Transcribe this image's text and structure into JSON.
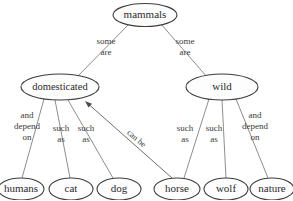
{
  "diagram": {
    "background_color": "#ffffff",
    "node_fill": "#fdfdfd",
    "node_stroke": "#3d3d3d",
    "connector_color": "#808080",
    "arrow_color": "#6e6e6e",
    "text_color": "#2b2b2b",
    "nodes": [
      {
        "id": "mammals",
        "label": "mammals",
        "cx": 145,
        "cy": 15,
        "rx": 32,
        "ry": 11.5
      },
      {
        "id": "domesticated",
        "label": "domesticated",
        "cx": 60,
        "cy": 87,
        "rx": 39,
        "ry": 13
      },
      {
        "id": "wild",
        "label": "wild",
        "cx": 222,
        "cy": 87,
        "rx": 36,
        "ry": 13
      },
      {
        "id": "humans",
        "label": "humans",
        "cx": 21,
        "cy": 189,
        "rx": 23,
        "ry": 11
      },
      {
        "id": "cat",
        "label": "cat",
        "cx": 71,
        "cy": 189,
        "rx": 22,
        "ry": 11
      },
      {
        "id": "dog",
        "label": "dog",
        "cx": 119,
        "cy": 189,
        "rx": 22,
        "ry": 11
      },
      {
        "id": "horse",
        "label": "horse",
        "cx": 177,
        "cy": 189,
        "rx": 23,
        "ry": 11
      },
      {
        "id": "wolf",
        "label": "wolf",
        "cx": 226,
        "cy": 189,
        "rx": 22,
        "ry": 11
      },
      {
        "id": "nature",
        "label": "nature",
        "cx": 272,
        "cy": 189,
        "rx": 22,
        "ry": 11
      }
    ],
    "edges": [
      {
        "id": "mammals-domesticated",
        "from": "mammals",
        "to": "domesticated",
        "label": "some are",
        "x1": 129,
        "y1": 24,
        "x2": 77,
        "y2": 77
      },
      {
        "id": "mammals-wild",
        "from": "mammals",
        "to": "wild",
        "label": "some are",
        "x1": 161,
        "y1": 24,
        "x2": 207,
        "y2": 77
      },
      {
        "id": "domesticated-humans",
        "from": "domesticated",
        "to": "humans",
        "label": "and depend on",
        "x1": 44,
        "y1": 99,
        "x2": 22,
        "y2": 178
      },
      {
        "id": "domesticated-cat",
        "from": "domesticated",
        "to": "cat",
        "label": "such as",
        "x1": 55,
        "y1": 100,
        "x2": 70,
        "y2": 178
      },
      {
        "id": "domesticated-dog",
        "from": "domesticated",
        "to": "dog",
        "label": "such as",
        "x1": 68,
        "y1": 100,
        "x2": 113,
        "y2": 178
      },
      {
        "id": "wild-wolf2",
        "from": "wild",
        "to": "horse",
        "label": "such as",
        "x1": 209,
        "y1": 99,
        "x2": 184,
        "y2": 178
      },
      {
        "id": "wild-wolf",
        "from": "wild",
        "to": "wolf",
        "label": "such as",
        "x1": 222,
        "y1": 100,
        "x2": 226,
        "y2": 178
      },
      {
        "id": "wild-nature",
        "from": "wild",
        "to": "nature",
        "label": "and depend on",
        "x1": 236,
        "y1": 99,
        "x2": 268,
        "y2": 178
      }
    ],
    "arrow": {
      "id": "horse-can-be-domesticated",
      "from": "horse",
      "to": "domesticated",
      "label": "can be",
      "x1": 172,
      "y1": 178,
      "x2": 85,
      "y2": 101
    },
    "edge_labels": [
      {
        "id": "label-some-are-left",
        "line1": "some",
        "line2": "are",
        "line3": "",
        "x": 106,
        "y": 47
      },
      {
        "id": "label-some-are-right",
        "line1": "some",
        "line2": "are",
        "line3": "",
        "x": 185,
        "y": 47
      },
      {
        "id": "label-and-depend-on-l",
        "line1": "and",
        "line2": "depend",
        "line3": "on",
        "x": 27,
        "y": 127
      },
      {
        "id": "label-such-as-cat",
        "line1": "such",
        "line2": "as",
        "line3": "",
        "x": 61,
        "y": 134
      },
      {
        "id": "label-such-as-dog",
        "line1": "such",
        "line2": "as",
        "line3": "",
        "x": 86,
        "y": 134
      },
      {
        "id": "label-such-as-horse",
        "line1": "such",
        "line2": "as",
        "line3": "",
        "x": 185,
        "y": 134
      },
      {
        "id": "label-such-as-wolf",
        "line1": "such",
        "line2": "as",
        "line3": "",
        "x": 214,
        "y": 134
      },
      {
        "id": "label-and-depend-on-r",
        "line1": "and",
        "line2": "depend",
        "line3": "on",
        "x": 255,
        "y": 127
      }
    ],
    "rotated_label": {
      "id": "label-can-be",
      "text": "can be",
      "x": 136,
      "y": 139,
      "angle": 41
    }
  }
}
